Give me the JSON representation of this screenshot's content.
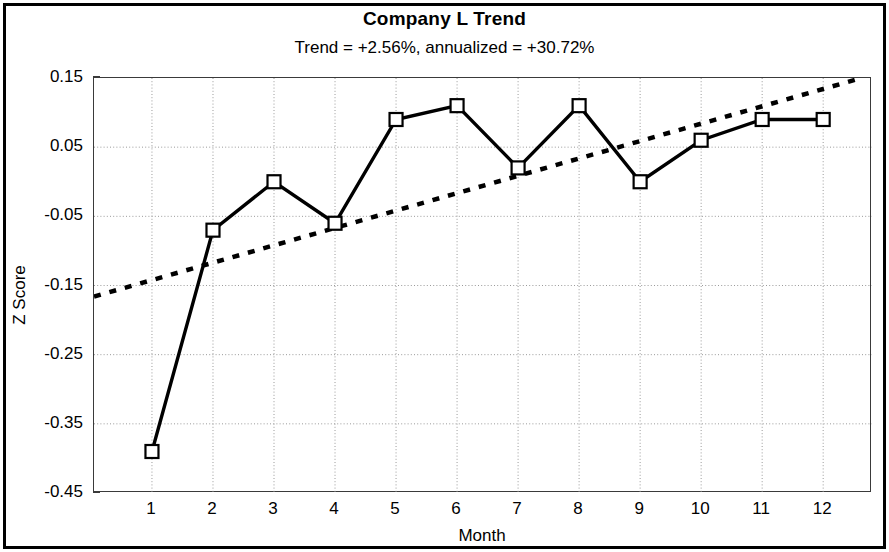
{
  "chart_data": {
    "type": "line",
    "title": "Company L Trend",
    "subtitle": "Trend = +2.56%,  annualized = +30.72%",
    "xlabel": "Month",
    "ylabel": "Z Score",
    "xlim": [
      0.05,
      12.8
    ],
    "ylim": [
      -0.45,
      0.15
    ],
    "grid": true,
    "legend": null,
    "x": [
      1,
      2,
      3,
      4,
      5,
      6,
      7,
      8,
      9,
      10,
      11,
      12
    ],
    "xtick_labels": [
      "1",
      "2",
      "3",
      "4",
      "5",
      "6",
      "7",
      "8",
      "9",
      "10",
      "11",
      "12"
    ],
    "ytick_values": [
      0.15,
      0.05,
      -0.05,
      -0.15,
      -0.25,
      -0.35,
      -0.45
    ],
    "ytick_labels": [
      "0.15",
      "0.05",
      "-0.05",
      "-0.15",
      "-0.25",
      "-0.35",
      "-0.45"
    ],
    "series": [
      {
        "name": "Z Score",
        "style": "solid-line-square-markers",
        "color": "#000000",
        "values": [
          -0.39,
          -0.07,
          0.0,
          -0.06,
          0.09,
          0.11,
          0.02,
          0.11,
          0.0,
          0.06,
          0.09,
          0.09
        ]
      },
      {
        "name": "Trend",
        "style": "dotted-line",
        "color": "#000000",
        "endpoints": [
          {
            "x": 0.05,
            "y": -0.166
          },
          {
            "x": 12.55,
            "y": 0.148
          }
        ]
      }
    ]
  },
  "figure": {
    "title": "Company L Trend",
    "subtitle": "Trend = +2.56%,  annualized = +30.72%",
    "xaxis_label": "Month",
    "yaxis_label": "Z Score"
  }
}
